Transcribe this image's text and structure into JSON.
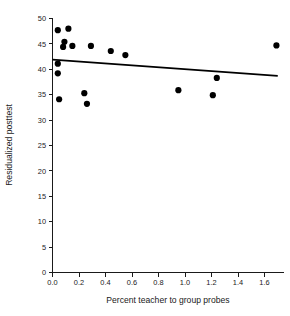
{
  "chart_data": {
    "type": "scatter",
    "title": "",
    "xlabel": "Percent teacher to group probes",
    "ylabel": "Residualized posttest",
    "xlim": [
      0.0,
      1.75
    ],
    "ylim": [
      0,
      50
    ],
    "grid": false,
    "legend": null,
    "xticks": [
      "0.0",
      "0.2",
      "0.4",
      "0.6",
      "0.8",
      "1.0",
      "1.2",
      "1.4",
      "1.6"
    ],
    "xtick_values": [
      0.0,
      0.2,
      0.4,
      0.6,
      0.8,
      1.0,
      1.2,
      1.4,
      1.6
    ],
    "yticks": [
      "0",
      "5",
      "10",
      "15",
      "20",
      "25",
      "30",
      "35",
      "40",
      "45",
      "50"
    ],
    "ytick_values": [
      0,
      5,
      10,
      15,
      20,
      25,
      30,
      35,
      40,
      45,
      50
    ],
    "points": [
      {
        "x": 0.04,
        "y": 47.7
      },
      {
        "x": 0.12,
        "y": 48.0
      },
      {
        "x": 0.09,
        "y": 45.4
      },
      {
        "x": 0.08,
        "y": 44.4
      },
      {
        "x": 0.15,
        "y": 44.6
      },
      {
        "x": 0.29,
        "y": 44.6
      },
      {
        "x": 0.44,
        "y": 43.6
      },
      {
        "x": 0.55,
        "y": 42.8
      },
      {
        "x": 0.04,
        "y": 41.1
      },
      {
        "x": 0.04,
        "y": 39.2
      },
      {
        "x": 0.05,
        "y": 34.1
      },
      {
        "x": 0.24,
        "y": 35.3
      },
      {
        "x": 0.26,
        "y": 33.2
      },
      {
        "x": 0.95,
        "y": 35.9
      },
      {
        "x": 1.24,
        "y": 38.3
      },
      {
        "x": 1.21,
        "y": 34.9
      },
      {
        "x": 1.69,
        "y": 44.7
      }
    ],
    "trendline": {
      "type": "linear-fit",
      "x_start": 0.0,
      "y_start": 41.9,
      "x_end": 1.7,
      "y_end": 38.7
    },
    "marker": {
      "shape": "circle",
      "color": "#000000",
      "size_px": 3.1
    },
    "axis_color": "#1a1a1a",
    "background_color": "#ffffff"
  }
}
